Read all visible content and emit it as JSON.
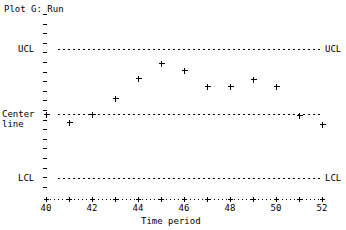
{
  "chart_data": {
    "type": "scatter",
    "title": "Plot G: Run",
    "xlabel": "Time period",
    "ylabel": "",
    "marker": "+",
    "grid": false,
    "legend": "none",
    "xlim": [
      39.5,
      52.6
    ],
    "xticks": [
      40,
      41,
      42,
      43,
      44,
      45,
      46,
      47,
      48,
      49,
      50,
      51,
      52
    ],
    "xtick_labels": [
      "40",
      "",
      "42",
      "",
      "44",
      "",
      "46",
      "",
      "48",
      "",
      "50",
      "",
      "52"
    ],
    "x": [
      40,
      41,
      42,
      43,
      44,
      45,
      46,
      47,
      48,
      49,
      50,
      51,
      52
    ],
    "y": [
      0.0,
      -0.45,
      0.0,
      0.95,
      2.05,
      2.95,
      2.55,
      1.6,
      1.6,
      2.0,
      1.6,
      -0.05,
      -0.55
    ],
    "control_limits": {
      "ucl": {
        "label": "UCL",
        "value": 3.75
      },
      "center": {
        "label": "Center line",
        "label_line1": "Center",
        "label_line2": "line",
        "value": 0.0
      },
      "lcl": {
        "label": "LCL",
        "value": -3.2
      }
    },
    "ylim": [
      -4.3,
      5.1
    ],
    "right_labels": {
      "ucl": "UCL",
      "lcl": "LCL"
    },
    "colors": {
      "ink": "#000000",
      "background": "#ffffff"
    }
  }
}
